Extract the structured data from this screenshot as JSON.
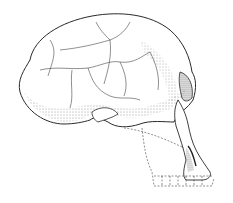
{
  "image": {
    "subject": "skull-illustration",
    "style": "stippled line drawing, lateral view",
    "colors": {
      "background": "#ffffff",
      "ink": "#2a2a2a",
      "shade": "#555555"
    }
  }
}
